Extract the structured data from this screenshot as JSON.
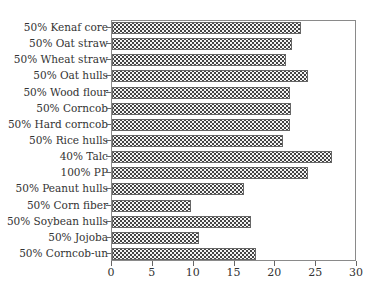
{
  "chart_data": {
    "type": "bar",
    "orientation": "horizontal",
    "title": "",
    "xlabel": "",
    "ylabel": "",
    "xlim": [
      0,
      30
    ],
    "xticks": [
      0,
      5,
      10,
      15,
      20,
      25,
      30
    ],
    "grid": false,
    "legend": null,
    "categories": [
      "50% Kenaf core",
      "50% Oat straw",
      "50% Wheat straw",
      "50% Oat hulls",
      "50% Wood flour",
      "50% Corncob",
      "50% Hard corncob",
      "50% Rice hulls",
      "40% Talc",
      "100% PP",
      "50% Peanut hulls",
      "50% Corn fiber",
      "50% Soybean hulls",
      "50% Jojoba",
      "50% Corncob-un"
    ],
    "values": [
      23.2,
      22.0,
      21.3,
      24.0,
      21.8,
      21.9,
      21.8,
      20.9,
      26.9,
      24.0,
      16.2,
      9.7,
      17.0,
      10.7,
      17.6
    ]
  }
}
